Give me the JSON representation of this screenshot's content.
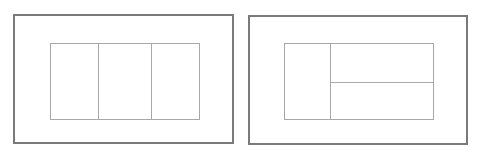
{
  "diagrams": [
    {
      "id": "layout-a",
      "description": "Outer frame containing inner rectangle split into three vertical columns",
      "columns": 3,
      "rows": 1,
      "border_color": "#7a7a7a",
      "divider_color": "#a8a8a8"
    },
    {
      "id": "layout-b",
      "description": "Outer frame containing inner rectangle split into a left column and a right area divided into two stacked rows",
      "columns": 2,
      "right_rows": 2,
      "border_color": "#7a7a7a",
      "divider_color": "#a8a8a8"
    }
  ]
}
